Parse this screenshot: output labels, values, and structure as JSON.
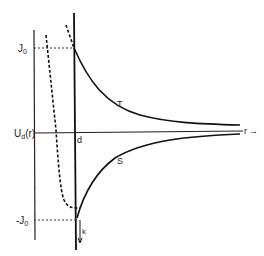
{
  "diagram": {
    "labels": {
      "j0_top": "J",
      "j0_top_sub": "0",
      "j0_bottom": "-J",
      "j0_bottom_sub": "0",
      "potential": "U",
      "potential_sub": "d",
      "potential_arg": "(r)",
      "d": "d",
      "r_axis": "r",
      "r_arrow": "→",
      "curve_upper": "T",
      "curve_lower": "S",
      "k": "k"
    },
    "colors": {
      "line": "#1a1a1a",
      "background": "#ffffff"
    }
  }
}
